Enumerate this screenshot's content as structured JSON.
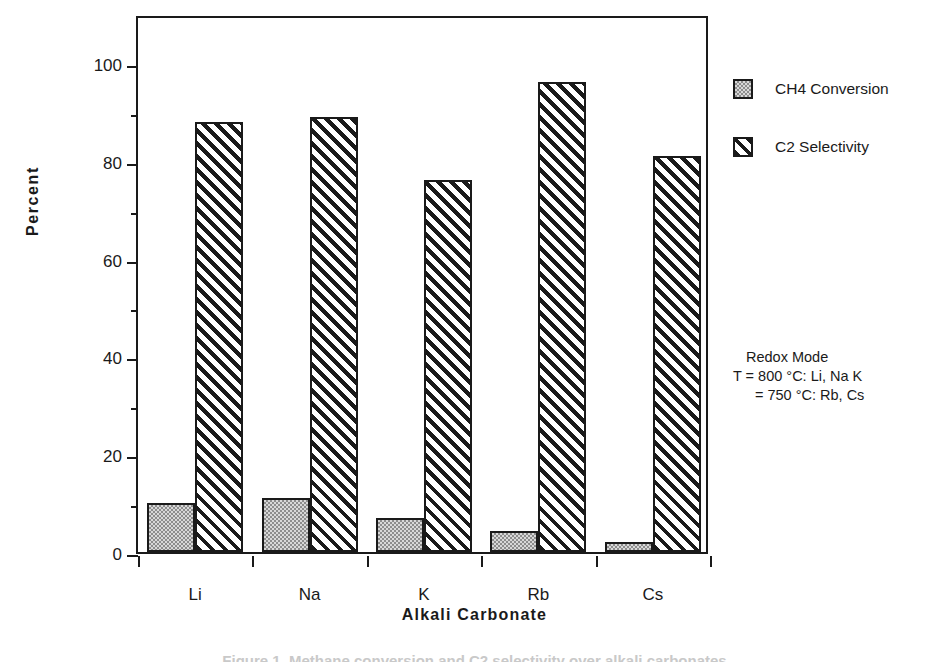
{
  "chart_data": {
    "type": "bar",
    "title": "",
    "xlabel": "Alkali  Carbonate",
    "ylabel": "Percent",
    "categories": [
      "Li",
      "Na",
      "K",
      "Rb",
      "Cs"
    ],
    "series": [
      {
        "name": "CH4 Conversion",
        "values": [
          10,
          11,
          7,
          4.3,
          2
        ],
        "pattern": "stipple"
      },
      {
        "name": "C2 Selectivity",
        "values": [
          88,
          89,
          76,
          96,
          81
        ],
        "pattern": "diagonal-hatch"
      }
    ],
    "ylim": [
      0,
      110
    ],
    "y_major_ticks": [
      0,
      20,
      40,
      60,
      80,
      100
    ],
    "y_minor_ticks": [
      10,
      30,
      50,
      70,
      90
    ],
    "grid": false,
    "legend_position": "right-top",
    "annotations": [
      "Redox Mode",
      "T = 800 °C: Li, Na K",
      "= 750 °C: Rb, Cs"
    ]
  },
  "axes": {
    "y_title": "Percent",
    "x_title": "Alkali  Carbonate",
    "y_tick_labels": [
      "100",
      "80",
      "60",
      "40",
      "20",
      "0"
    ],
    "x_tick_labels": [
      "Li",
      "Na",
      "K",
      "Rb",
      "Cs"
    ]
  },
  "legend": {
    "items": [
      {
        "label": "CH4 Conversion",
        "swatch": "stipple-swatch-icon"
      },
      {
        "label": "C2 Selectivity",
        "swatch": "hatch-swatch-icon"
      }
    ]
  },
  "annotation": {
    "lines": [
      "Redox Mode",
      "T = 800 °C: Li, Na K",
      "= 750 °C: Rb, Cs"
    ]
  },
  "caption": {
    "text": "Figure 1.  Methane conversion and C2 selectivity over alkali carbonates"
  },
  "colors": {
    "ink": "#1a1a1a",
    "background": "#ffffff",
    "stipple_fill": "#d8d8d8",
    "hatch_fill": "#1a1a1a"
  }
}
